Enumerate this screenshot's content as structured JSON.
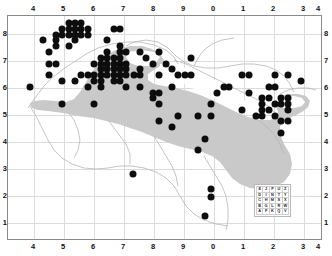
{
  "figure": {
    "title": "",
    "background": "#ffffff",
    "frame_color": "#8a8a8a",
    "grid_color": "#dcdcdc",
    "land_color": "#ffffff",
    "range_color": "#c9c9c9",
    "dot_color": "#0d0d0d"
  },
  "axes": {
    "top_ticks": [
      "4",
      "5",
      "6",
      "7",
      "8",
      "9",
      "0",
      "1",
      "2",
      "3",
      "4"
    ],
    "bottom_ticks": [
      "4",
      "5",
      "6",
      "7",
      "8",
      "9",
      "0",
      "1",
      "2",
      "3",
      "4"
    ],
    "left_ticks": [
      "8",
      "7",
      "6",
      "5",
      "4",
      "3",
      "2",
      "1"
    ],
    "right_ticks": [
      "8",
      "7",
      "6",
      "5",
      "4",
      "3",
      "2",
      "1"
    ],
    "xlabel": "",
    "ylabel": ""
  },
  "legend": {
    "name": "utm-100km-square-letter-grid",
    "rows": [
      [
        "E",
        "J",
        "P",
        "U",
        "Z"
      ],
      [
        "D",
        "I",
        "N",
        "T",
        "Y"
      ],
      [
        "C",
        "H",
        "M",
        "S",
        "X"
      ],
      [
        "B",
        "G",
        "L",
        "R",
        "W"
      ],
      [
        "A",
        "F",
        "K",
        "Q",
        "V"
      ]
    ]
  },
  "chart_data": {
    "type": "scatter",
    "title": "",
    "xlabel": "",
    "ylabel": "",
    "xlim": [
      0,
      10
    ],
    "ylim": [
      0,
      7
    ],
    "grid": true,
    "legend_position": "inside-bottom-right",
    "x_tick_labels": [
      "4",
      "5",
      "6",
      "7",
      "8",
      "9",
      "0",
      "1",
      "2",
      "3",
      "4"
    ],
    "y_tick_labels": [
      "8",
      "7",
      "6",
      "5",
      "4",
      "3",
      "2",
      "1"
    ],
    "series": [
      {
        "name": "occurrence-records",
        "marker": "filled-circle",
        "color": "#0d0d0d",
        "count": 152,
        "points": [
          [
            1.93,
            6.78
          ],
          [
            2.12,
            6.78
          ],
          [
            2.33,
            6.78
          ],
          [
            1.72,
            6.6
          ],
          [
            1.93,
            6.6
          ],
          [
            2.12,
            6.6
          ],
          [
            2.33,
            6.6
          ],
          [
            2.53,
            6.6
          ],
          [
            3.35,
            6.6
          ],
          [
            3.56,
            6.6
          ],
          [
            1.52,
            6.42
          ],
          [
            1.72,
            6.42
          ],
          [
            1.93,
            6.42
          ],
          [
            2.12,
            6.42
          ],
          [
            2.33,
            6.42
          ],
          [
            2.53,
            6.42
          ],
          [
            1.1,
            6.24
          ],
          [
            1.52,
            6.24
          ],
          [
            2.12,
            6.24
          ],
          [
            3.15,
            6.24
          ],
          [
            1.52,
            6.06
          ],
          [
            1.93,
            6.06
          ],
          [
            3.56,
            6.06
          ],
          [
            1.31,
            5.88
          ],
          [
            3.15,
            5.88
          ],
          [
            3.56,
            5.88
          ],
          [
            3.76,
            5.88
          ],
          [
            4.18,
            5.88
          ],
          [
            4.8,
            5.88
          ],
          [
            2.95,
            5.7
          ],
          [
            3.15,
            5.7
          ],
          [
            3.35,
            5.7
          ],
          [
            3.56,
            5.7
          ],
          [
            4.38,
            5.7
          ],
          [
            5.82,
            5.7
          ],
          [
            1.31,
            5.52
          ],
          [
            1.52,
            5.52
          ],
          [
            2.74,
            5.52
          ],
          [
            2.95,
            5.52
          ],
          [
            3.15,
            5.52
          ],
          [
            3.35,
            5.52
          ],
          [
            3.56,
            5.52
          ],
          [
            3.76,
            5.52
          ],
          [
            4.59,
            5.52
          ],
          [
            5.0,
            5.52
          ],
          [
            2.95,
            5.34
          ],
          [
            3.15,
            5.34
          ],
          [
            3.35,
            5.34
          ],
          [
            3.56,
            5.34
          ],
          [
            3.76,
            5.34
          ],
          [
            4.18,
            5.34
          ],
          [
            5.2,
            5.34
          ],
          [
            1.31,
            5.16
          ],
          [
            2.33,
            5.16
          ],
          [
            2.53,
            5.16
          ],
          [
            2.74,
            5.16
          ],
          [
            2.95,
            5.16
          ],
          [
            3.15,
            5.16
          ],
          [
            3.35,
            5.16
          ],
          [
            3.56,
            5.16
          ],
          [
            3.76,
            5.16
          ],
          [
            4.0,
            5.16
          ],
          [
            4.18,
            5.16
          ],
          [
            4.8,
            5.16
          ],
          [
            5.41,
            5.16
          ],
          [
            5.61,
            5.16
          ],
          [
            5.82,
            5.16
          ],
          [
            7.44,
            5.16
          ],
          [
            7.65,
            5.16
          ],
          [
            8.48,
            5.16
          ],
          [
            8.89,
            5.16
          ],
          [
            1.72,
            4.98
          ],
          [
            2.12,
            4.98
          ],
          [
            2.74,
            4.98
          ],
          [
            2.95,
            4.98
          ],
          [
            3.35,
            4.98
          ],
          [
            3.56,
            4.98
          ],
          [
            9.3,
            4.98
          ],
          [
            0.7,
            4.8
          ],
          [
            2.53,
            4.8
          ],
          [
            2.95,
            4.8
          ],
          [
            3.76,
            4.8
          ],
          [
            4.18,
            4.8
          ],
          [
            5.2,
            4.8
          ],
          [
            6.85,
            4.8
          ],
          [
            7.03,
            4.8
          ],
          [
            8.27,
            4.8
          ],
          [
            8.48,
            4.8
          ],
          [
            4.59,
            4.62
          ],
          [
            4.8,
            4.62
          ],
          [
            6.65,
            4.62
          ],
          [
            7.65,
            4.62
          ],
          [
            4.59,
            4.44
          ],
          [
            8.06,
            4.44
          ],
          [
            8.27,
            4.44
          ],
          [
            8.68,
            4.44
          ],
          [
            8.89,
            4.44
          ],
          [
            1.72,
            4.26
          ],
          [
            2.74,
            4.26
          ],
          [
            4.8,
            4.26
          ],
          [
            6.44,
            4.26
          ],
          [
            8.06,
            4.26
          ],
          [
            8.48,
            4.26
          ],
          [
            8.68,
            4.26
          ],
          [
            8.89,
            4.26
          ],
          [
            7.44,
            4.08
          ],
          [
            8.06,
            4.08
          ],
          [
            8.27,
            4.08
          ],
          [
            8.89,
            4.08
          ],
          [
            5.41,
            3.9
          ],
          [
            6.03,
            3.9
          ],
          [
            6.44,
            3.9
          ],
          [
            7.86,
            3.9
          ],
          [
            8.06,
            3.9
          ],
          [
            8.48,
            3.9
          ],
          [
            4.8,
            3.72
          ],
          [
            8.68,
            3.72
          ],
          [
            8.89,
            3.72
          ],
          [
            5.2,
            3.54
          ],
          [
            8.68,
            3.36
          ],
          [
            6.24,
            3.18
          ],
          [
            6.03,
            2.82
          ],
          [
            3.97,
            2.1
          ],
          [
            6.44,
            1.62
          ],
          [
            6.44,
            1.38
          ],
          [
            6.24,
            0.78
          ]
        ]
      }
    ]
  }
}
